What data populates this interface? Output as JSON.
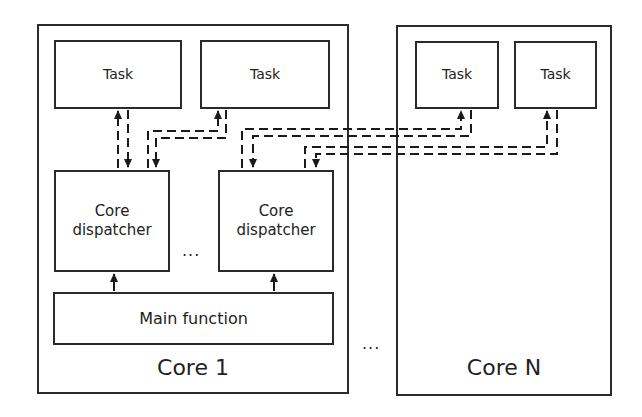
{
  "diagram": {
    "type": "architecture",
    "cores": [
      {
        "label": "Core 1",
        "tasks": [
          "Task",
          "Task"
        ],
        "dispatchers": [
          "Core dispatcher",
          "Core dispatcher"
        ],
        "dispatcher_lines": [
          [
            "Core",
            "dispatcher"
          ],
          [
            "Core",
            "dispatcher"
          ]
        ],
        "main": "Main function"
      },
      {
        "label": "Core N",
        "tasks": [
          "Task",
          "Task"
        ]
      }
    ],
    "ellipsis_between_dispatchers": "...",
    "ellipsis_between_cores": "...",
    "connections": [
      {
        "from": "Core 1 / Core dispatcher 1",
        "to": "Core 1 / Task 1",
        "style": "dashed bidirectional"
      },
      {
        "from": "Core 1 / Core dispatcher 1",
        "to": "Core 1 / Task 2",
        "style": "dashed bidirectional"
      },
      {
        "from": "Core 1 / Core dispatcher 2",
        "to": "Core N / Task 1",
        "style": "dashed bidirectional"
      },
      {
        "from": "Core 1 / Core dispatcher 2",
        "to": "Core N / Task 2",
        "style": "dashed bidirectional"
      },
      {
        "from": "Core 1 / Main function",
        "to": "Core 1 / Core dispatcher 1",
        "style": "solid arrow"
      },
      {
        "from": "Core 1 / Main function",
        "to": "Core 1 / Core dispatcher 2",
        "style": "solid arrow"
      }
    ],
    "colors": {
      "stroke": "#2a2a2a",
      "background": "#ffffff"
    }
  }
}
